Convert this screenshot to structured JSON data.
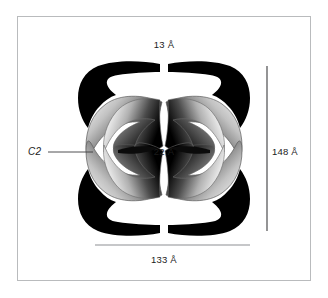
{
  "figure": {
    "type": "molecular-structure-schematic",
    "background_color": "#ffffff",
    "frame_color": "#b9bbbd"
  },
  "labels": {
    "top_dimension": "13 Å",
    "center_dimension": "22 Å",
    "right_dimension": "148 Å",
    "bottom_dimension": "133 Å",
    "symmetry_axis": "C2"
  },
  "measurements": {
    "top_gap": {
      "value": 13,
      "unit": "Å",
      "text": "13 Å"
    },
    "central_waist": {
      "value": 22,
      "unit": "Å",
      "text": "22 Å"
    },
    "height": {
      "value": 148,
      "unit": "Å",
      "text": "148 Å"
    },
    "width": {
      "value": 133,
      "unit": "Å",
      "text": "133 Å"
    }
  },
  "annotations": {
    "symmetry": {
      "name": "C2",
      "label": "C2",
      "style": "italic",
      "leader_line": true
    }
  },
  "colors": {
    "subunit_dark": "#000000",
    "blade_gradient_dark": "#1a1a1a",
    "blade_gradient_mid": "#8d8d8d",
    "blade_gradient_light": "#f2f2f2",
    "outline": "#5a5a5a",
    "dimension_line": "#6e6e70",
    "text": "#1b1b1b"
  }
}
